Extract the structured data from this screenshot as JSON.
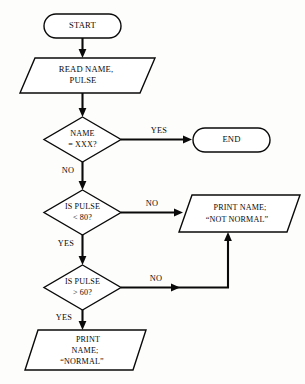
{
  "diagram": {
    "type": "flowchart",
    "colors": {
      "stroke": "#0a0a0a",
      "fill": "#ffffff",
      "background": "#fdfdfb"
    },
    "nodes": [
      {
        "id": "start",
        "shape": "terminator",
        "lines": [
          "START"
        ]
      },
      {
        "id": "read-input",
        "shape": "parallelogram",
        "lines": [
          "READ NAME,",
          "PULSE"
        ]
      },
      {
        "id": "decision-name",
        "shape": "diamond",
        "lines": [
          "NAME",
          "= XXX?"
        ]
      },
      {
        "id": "end",
        "shape": "terminator",
        "lines": [
          "END"
        ]
      },
      {
        "id": "decision-pulse-under-80",
        "shape": "diamond",
        "lines": [
          "IS PULSE",
          "< 80?"
        ]
      },
      {
        "id": "print-not-normal",
        "shape": "parallelogram",
        "lines": [
          "PRINT NAME;",
          "“NOT NORMAL”"
        ]
      },
      {
        "id": "decision-pulse-over-60",
        "shape": "diamond",
        "lines": [
          "IS PULSE",
          "> 60?"
        ]
      },
      {
        "id": "print-normal",
        "shape": "parallelogram",
        "lines": [
          "PRINT",
          "NAME;",
          "“NORMAL”"
        ]
      }
    ],
    "branch_labels": {
      "name_yes": "YES",
      "name_no": "NO",
      "pulse80_no": "NO",
      "pulse80_yes": "YES",
      "pulse60_no": "NO",
      "pulse60_yes": "YES"
    }
  }
}
